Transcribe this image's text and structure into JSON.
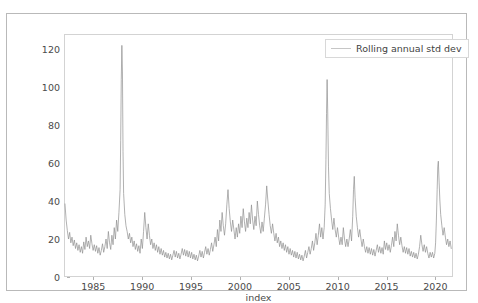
{
  "page": {
    "title": "PERFORMANCE: Pro with Your Cost Metric Forecast"
  },
  "legend": {
    "label": "Rolling annual std dev",
    "position": "upper-right",
    "line_color": "#c6c6c6"
  },
  "axes": {
    "xlabel": "index",
    "ylabel": "",
    "xticks": [
      "1985",
      "1990",
      "1995",
      "2000",
      "2005",
      "2010",
      "2015",
      "2020"
    ],
    "yticks": [
      "0",
      "20",
      "40",
      "60",
      "80",
      "100",
      "120"
    ]
  },
  "colors": {
    "line": "#8f8f8f",
    "frame": "#d3d3d3",
    "card_border": "#b9b9b9",
    "tick_text": "#4a4a4a",
    "background": "#ffffff"
  },
  "chart_data": {
    "type": "line",
    "title": "PERFORMANCE: Pro with Your Cost Metric Forecast",
    "xlabel": "index",
    "ylabel": "",
    "grid": false,
    "legend_position": "upper right",
    "xlim": [
      1982.0,
      2021.8
    ],
    "ylim": [
      0,
      128
    ],
    "series": [
      {
        "name": "Rolling annual std dev",
        "color": "#8f8f8f",
        "x": [
          1982.1,
          1982.22,
          1982.34,
          1982.46,
          1982.58,
          1982.7,
          1982.82,
          1982.94,
          1983.06,
          1983.18,
          1983.3,
          1983.42,
          1983.54,
          1983.66,
          1983.78,
          1983.9,
          1984.02,
          1984.14,
          1984.26,
          1984.38,
          1984.5,
          1984.62,
          1984.74,
          1984.86,
          1984.98,
          1985.1,
          1985.22,
          1985.34,
          1985.46,
          1985.58,
          1985.7,
          1985.82,
          1985.94,
          1986.06,
          1986.18,
          1986.3,
          1986.42,
          1986.54,
          1986.66,
          1986.78,
          1986.9,
          1987.02,
          1987.14,
          1987.26,
          1987.38,
          1987.5,
          1987.62,
          1987.74,
          1987.8,
          1987.86,
          1987.92,
          1987.98,
          1988.04,
          1988.1,
          1988.22,
          1988.34,
          1988.46,
          1988.58,
          1988.7,
          1988.82,
          1988.94,
          1989.06,
          1989.18,
          1989.3,
          1989.42,
          1989.54,
          1989.66,
          1989.78,
          1989.9,
          1990.02,
          1990.14,
          1990.26,
          1990.38,
          1990.5,
          1990.62,
          1990.74,
          1990.86,
          1990.98,
          1991.1,
          1991.22,
          1991.34,
          1991.46,
          1991.58,
          1991.7,
          1991.82,
          1991.94,
          1992.06,
          1992.18,
          1992.3,
          1992.42,
          1992.54,
          1992.66,
          1992.78,
          1992.9,
          1993.02,
          1993.14,
          1993.26,
          1993.38,
          1993.5,
          1993.62,
          1993.74,
          1993.86,
          1993.98,
          1994.1,
          1994.22,
          1994.34,
          1994.46,
          1994.58,
          1994.7,
          1994.82,
          1994.94,
          1995.06,
          1995.18,
          1995.3,
          1995.42,
          1995.54,
          1995.66,
          1995.78,
          1995.9,
          1996.02,
          1996.14,
          1996.26,
          1996.38,
          1996.5,
          1996.62,
          1996.74,
          1996.86,
          1996.98,
          1997.1,
          1997.22,
          1997.34,
          1997.46,
          1997.58,
          1997.7,
          1997.82,
          1997.94,
          1998.06,
          1998.18,
          1998.3,
          1998.42,
          1998.54,
          1998.66,
          1998.78,
          1998.9,
          1999.02,
          1999.14,
          1999.26,
          1999.38,
          1999.5,
          1999.62,
          1999.74,
          1999.86,
          1999.98,
          2000.1,
          2000.22,
          2000.34,
          2000.46,
          2000.58,
          2000.7,
          2000.82,
          2000.94,
          2001.06,
          2001.18,
          2001.3,
          2001.42,
          2001.54,
          2001.66,
          2001.78,
          2001.9,
          2002.02,
          2002.14,
          2002.26,
          2002.38,
          2002.5,
          2002.62,
          2002.74,
          2002.86,
          2002.98,
          2003.1,
          2003.22,
          2003.34,
          2003.46,
          2003.58,
          2003.7,
          2003.82,
          2003.94,
          2004.06,
          2004.18,
          2004.3,
          2004.42,
          2004.54,
          2004.66,
          2004.78,
          2004.9,
          2005.02,
          2005.14,
          2005.26,
          2005.38,
          2005.5,
          2005.62,
          2005.74,
          2005.86,
          2005.98,
          2006.1,
          2006.22,
          2006.34,
          2006.46,
          2006.58,
          2006.7,
          2006.82,
          2006.94,
          2007.06,
          2007.18,
          2007.3,
          2007.42,
          2007.54,
          2007.66,
          2007.78,
          2007.9,
          2008.02,
          2008.14,
          2008.26,
          2008.38,
          2008.5,
          2008.62,
          2008.72,
          2008.8,
          2008.86,
          2008.92,
          2008.98,
          2009.06,
          2009.14,
          2009.26,
          2009.38,
          2009.5,
          2009.62,
          2009.74,
          2009.86,
          2009.98,
          2010.1,
          2010.22,
          2010.34,
          2010.46,
          2010.58,
          2010.7,
          2010.82,
          2010.94,
          2011.06,
          2011.18,
          2011.3,
          2011.42,
          2011.54,
          2011.62,
          2011.7,
          2011.78,
          2011.9,
          2012.02,
          2012.14,
          2012.26,
          2012.38,
          2012.5,
          2012.62,
          2012.74,
          2012.86,
          2012.98,
          2013.1,
          2013.22,
          2013.34,
          2013.46,
          2013.58,
          2013.7,
          2013.82,
          2013.94,
          2014.06,
          2014.18,
          2014.3,
          2014.42,
          2014.54,
          2014.66,
          2014.78,
          2014.9,
          2015.02,
          2015.14,
          2015.26,
          2015.38,
          2015.5,
          2015.62,
          2015.74,
          2015.86,
          2015.98,
          2016.1,
          2016.22,
          2016.34,
          2016.46,
          2016.58,
          2016.7,
          2016.82,
          2016.94,
          2017.06,
          2017.18,
          2017.3,
          2017.42,
          2017.54,
          2017.66,
          2017.78,
          2017.9,
          2018.02,
          2018.14,
          2018.26,
          2018.38,
          2018.5,
          2018.62,
          2018.74,
          2018.86,
          2018.98,
          2019.1,
          2019.22,
          2019.34,
          2019.46,
          2019.58,
          2019.7,
          2019.82,
          2019.94,
          2020.02,
          2020.1,
          2020.18,
          2020.24,
          2020.3,
          2020.38,
          2020.46,
          2020.54,
          2020.66,
          2020.78,
          2020.9,
          2021.02,
          2021.14,
          2021.26,
          2021.38,
          2021.5,
          2021.62
        ],
        "y": [
          38.5,
          30.0,
          24.5,
          20.0,
          23.5,
          18.0,
          21.0,
          16.5,
          19.5,
          15.0,
          18.0,
          14.0,
          17.0,
          13.0,
          16.0,
          12.5,
          18.5,
          14.5,
          21.0,
          16.0,
          19.0,
          15.0,
          22.0,
          17.5,
          14.0,
          17.0,
          13.5,
          16.5,
          12.5,
          15.5,
          11.5,
          14.0,
          17.5,
          13.0,
          16.0,
          20.0,
          15.0,
          24.0,
          18.0,
          14.5,
          22.0,
          17.0,
          26.0,
          20.0,
          30.0,
          24.0,
          34.0,
          46.0,
          72.0,
          104.0,
          122.0,
          108.0,
          66.0,
          44.0,
          33.0,
          27.0,
          24.0,
          20.0,
          23.0,
          18.0,
          21.0,
          16.0,
          19.0,
          14.5,
          17.5,
          13.5,
          16.5,
          12.5,
          20.0,
          15.0,
          24.0,
          34.0,
          26.0,
          20.0,
          28.0,
          22.0,
          17.0,
          20.0,
          15.0,
          18.0,
          14.0,
          17.0,
          13.0,
          16.0,
          12.0,
          15.0,
          11.5,
          14.0,
          10.5,
          13.0,
          10.0,
          12.5,
          9.5,
          12.0,
          9.0,
          11.5,
          14.0,
          10.5,
          13.5,
          10.0,
          12.5,
          9.5,
          12.0,
          15.0,
          11.5,
          14.5,
          11.0,
          14.0,
          10.5,
          13.5,
          10.0,
          13.0,
          9.5,
          12.0,
          9.0,
          11.5,
          8.5,
          11.0,
          14.0,
          10.5,
          13.5,
          10.0,
          13.0,
          16.0,
          12.0,
          15.0,
          11.5,
          14.5,
          18.0,
          13.5,
          17.0,
          21.0,
          16.0,
          25.0,
          19.0,
          30.0,
          24.0,
          34.0,
          27.0,
          22.0,
          28.0,
          38.0,
          46.0,
          36.0,
          29.0,
          24.0,
          30.0,
          25.0,
          20.0,
          26.0,
          21.0,
          28.0,
          23.0,
          32.0,
          26.0,
          36.0,
          29.0,
          24.0,
          31.0,
          26.0,
          34.0,
          28.0,
          38.0,
          30.0,
          25.0,
          32.0,
          27.0,
          40.0,
          33.0,
          27.0,
          23.0,
          29.0,
          24.0,
          31.0,
          38.0,
          48.0,
          40.0,
          33.0,
          27.0,
          23.0,
          28.0,
          23.0,
          19.0,
          23.0,
          18.0,
          21.0,
          16.0,
          19.0,
          15.0,
          18.0,
          14.0,
          17.0,
          13.0,
          16.0,
          12.0,
          15.0,
          11.5,
          14.0,
          10.5,
          13.5,
          10.0,
          13.0,
          9.5,
          12.0,
          9.0,
          11.5,
          8.5,
          11.0,
          14.0,
          10.0,
          13.0,
          16.0,
          12.0,
          15.0,
          19.0,
          14.0,
          18.0,
          23.0,
          17.0,
          22.0,
          28.0,
          21.0,
          26.0,
          20.0,
          26.0,
          38.0,
          62.0,
          86.0,
          104.0,
          88.0,
          58.0,
          44.0,
          36.0,
          30.0,
          25.0,
          31.0,
          25.0,
          21.0,
          26.0,
          21.0,
          17.0,
          21.0,
          17.0,
          26.0,
          20.0,
          16.0,
          20.0,
          16.0,
          20.0,
          25.0,
          19.0,
          32.0,
          46.0,
          53.0,
          42.0,
          32.0,
          26.0,
          21.0,
          25.0,
          20.0,
          16.0,
          20.0,
          16.0,
          13.0,
          16.0,
          12.5,
          15.5,
          12.0,
          15.0,
          11.5,
          14.5,
          11.0,
          14.0,
          17.0,
          13.0,
          16.0,
          12.5,
          15.5,
          12.0,
          19.0,
          14.5,
          18.0,
          14.0,
          17.0,
          13.0,
          16.5,
          21.0,
          16.0,
          24.0,
          19.0,
          28.0,
          22.0,
          17.0,
          21.0,
          16.5,
          13.0,
          16.0,
          12.5,
          15.5,
          12.0,
          15.0,
          11.0,
          13.5,
          10.5,
          13.0,
          10.0,
          12.5,
          9.5,
          12.0,
          16.0,
          22.0,
          17.0,
          13.5,
          17.0,
          13.0,
          16.0,
          12.5,
          10.0,
          13.0,
          10.5,
          13.0,
          10.0,
          12.5,
          18.0,
          30.0,
          46.0,
          58.0,
          61.0,
          50.0,
          40.0,
          33.0,
          27.0,
          22.0,
          26.0,
          21.0,
          17.0,
          20.0,
          16.0,
          19.0,
          15.0
        ]
      }
    ]
  }
}
